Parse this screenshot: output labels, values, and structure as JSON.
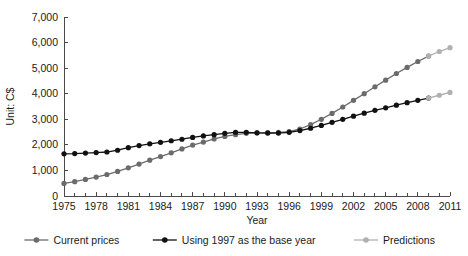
{
  "chart_data": {
    "type": "line",
    "title": "",
    "xlabel": "Year",
    "ylabel": "Unit: C$",
    "xlim": [
      1975,
      2011
    ],
    "ylim": [
      0,
      7000
    ],
    "grid": false,
    "legend_position": "bottom",
    "ytick_labels": [
      "0",
      "1,000",
      "2,000",
      "3,000",
      "4,000",
      "5,000",
      "6,000",
      "7,000"
    ],
    "ytick_values": [
      0,
      1000,
      2000,
      3000,
      4000,
      5000,
      6000,
      7000
    ],
    "xtick_labels": [
      "1975",
      "1978",
      "1981",
      "1984",
      "1987",
      "1990",
      "1993",
      "1996",
      "1999",
      "2002",
      "2005",
      "2008",
      "2011"
    ],
    "xtick_values": [
      1975,
      1978,
      1981,
      1984,
      1987,
      1990,
      1993,
      1996,
      1999,
      2002,
      2005,
      2008,
      2011
    ],
    "x": [
      1975,
      1976,
      1977,
      1978,
      1979,
      1980,
      1981,
      1982,
      1983,
      1984,
      1985,
      1986,
      1987,
      1988,
      1989,
      1990,
      1991,
      1992,
      1993,
      1994,
      1995,
      1996,
      1997,
      1998,
      1999,
      2000,
      2001,
      2002,
      2003,
      2004,
      2005,
      2006,
      2007,
      2008,
      2009,
      2010,
      2011
    ],
    "series": [
      {
        "name": "Current prices",
        "color": "#6b6b6b",
        "marker": "circle",
        "values": [
          490,
          560,
          650,
          740,
          840,
          960,
          1100,
          1250,
          1400,
          1540,
          1690,
          1840,
          1990,
          2110,
          2230,
          2330,
          2400,
          2450,
          2470,
          2480,
          2490,
          2520,
          2620,
          2790,
          3000,
          3230,
          3480,
          3740,
          4000,
          4270,
          4530,
          4790,
          5030,
          5260,
          5470,
          null,
          null
        ]
      },
      {
        "name": "Using 1997 as the base year",
        "color": "#111111",
        "marker": "circle",
        "values": [
          1650,
          1660,
          1680,
          1700,
          1720,
          1790,
          1890,
          1970,
          2040,
          2100,
          2160,
          2220,
          2290,
          2350,
          2400,
          2450,
          2490,
          2490,
          2470,
          2460,
          2460,
          2490,
          2560,
          2650,
          2760,
          2880,
          3000,
          3120,
          3240,
          3350,
          3450,
          3550,
          3650,
          3740,
          3830,
          null,
          null
        ]
      },
      {
        "name": "Predictions",
        "color": "#b0b0b0",
        "marker": "circle",
        "values_current": [
          5470,
          5650,
          5800
        ],
        "values_base": [
          3830,
          3940,
          4050
        ],
        "x_prediction": [
          2009,
          2010,
          2011
        ]
      }
    ],
    "legend": [
      {
        "label": "Current prices",
        "color": "#6b6b6b"
      },
      {
        "label": "Using 1997 as the base year",
        "color": "#111111"
      },
      {
        "label": "Predictions",
        "color": "#b0b0b0"
      }
    ]
  }
}
